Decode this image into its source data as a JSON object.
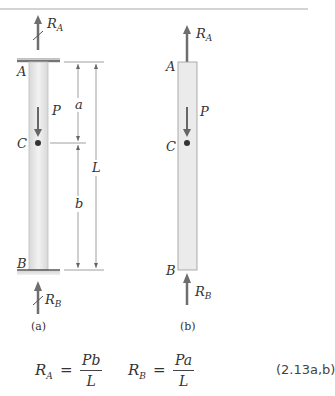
{
  "figure_a": {
    "caption": "(a)",
    "labels": {
      "reaction_a": "R",
      "reaction_a_sub": "A",
      "reaction_b": "R",
      "reaction_b_sub": "B",
      "point_a": "A",
      "point_b": "B",
      "point_c": "C",
      "load": "P",
      "dim_a": "a",
      "dim_b": "b",
      "dim_L": "L"
    }
  },
  "figure_b": {
    "caption": "(b)",
    "labels": {
      "reaction_a": "R",
      "reaction_a_sub": "A",
      "reaction_b": "R",
      "reaction_b_sub": "B",
      "point_a": "A",
      "point_b": "B",
      "point_c": "C",
      "load": "P"
    }
  },
  "equation": {
    "ra_symbol": "R",
    "ra_sub": "A",
    "equals": "=",
    "ra_num": "Pb",
    "ra_den": "L",
    "rb_symbol": "R",
    "rb_sub": "B",
    "rb_num": "Pa",
    "rb_den": "L",
    "number": "(2.13a,b)"
  },
  "colors": {
    "bar_fill": "#e8e8e8",
    "support": "#555555",
    "arrow": "#6e6e6e",
    "text": "#333333"
  }
}
